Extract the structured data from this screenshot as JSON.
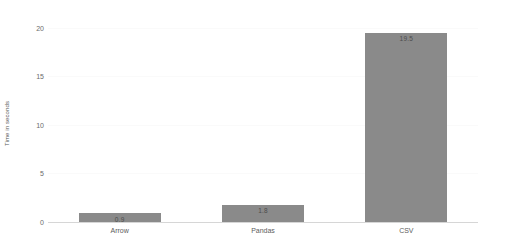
{
  "chart_data": {
    "type": "bar",
    "title": "",
    "xlabel": "",
    "ylabel": "Time in seconds",
    "categories": [
      "Arrow",
      "Pandas",
      "CSV"
    ],
    "values": [
      0.9,
      1.8,
      19.5
    ],
    "value_labels": [
      "0.9",
      "1.8",
      "19.5"
    ],
    "ylim": [
      0,
      20.8
    ],
    "yticks": [
      0,
      5,
      10,
      15,
      20
    ],
    "ytick_labels": [
      "0",
      "5",
      "10",
      "15",
      "20"
    ],
    "grid": true,
    "legend": false,
    "orientation": "vertical",
    "bar_color": "#8a8a8a",
    "value_label_color": "#4d4d4d",
    "axis_color": "#d6d6d6",
    "gridline_color": "#fafafa",
    "background": "#ffffff"
  }
}
